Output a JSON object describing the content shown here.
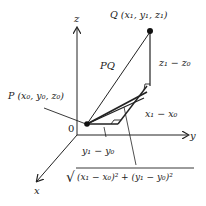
{
  "diagram": {
    "axes": {
      "x_label": "x",
      "y_label": "y",
      "z_label": "z",
      "origin_label": "0"
    },
    "points": {
      "P": {
        "label": "P (x₀, y₀, z₀)"
      },
      "Q": {
        "label": "Q (x₁, y₁, z₁)"
      }
    },
    "segment_labels": {
      "pq": "PQ",
      "dz": "z₁ − z₀",
      "dx": "x₁ − x₀",
      "dy": "y₁ − y₀",
      "hyp_xy": "√(x₁ − x₀)² + (y₁ − y₀)²",
      "hyp_xy_radicand": "(x₁ − x₀)² + (y₁ − y₀)²",
      "radical_sign": "√"
    },
    "colors": {
      "stroke": "#222222",
      "background": "#ffffff"
    }
  }
}
